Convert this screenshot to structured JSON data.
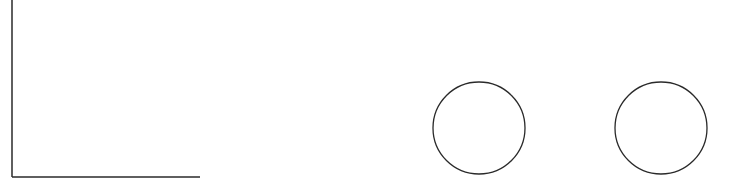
{
  "canvas": {
    "width": 742,
    "height": 188,
    "background": "#ffffff"
  },
  "stroke_color": "#2a2a2a",
  "shapes": {
    "axes": {
      "origin_x": 12,
      "origin_y": 177,
      "top_y": 0,
      "right_x": 200
    },
    "circles": [
      {
        "cx": 479,
        "cy": 128,
        "r": 46
      },
      {
        "cx": 661,
        "cy": 128,
        "r": 46
      }
    ]
  }
}
